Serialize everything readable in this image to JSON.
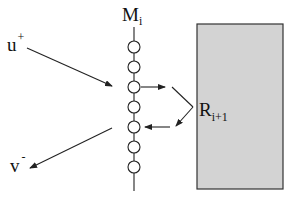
{
  "diagram": {
    "chain_label": {
      "main": "M",
      "sub": "i"
    },
    "incoming_label": {
      "main": "u",
      "sup": "+"
    },
    "outgoing_label": {
      "main": "v",
      "sup": "-"
    },
    "region_label": {
      "main": "R",
      "sub": "i+1"
    },
    "chain_node_count": 7,
    "colors": {
      "stroke": "#222222",
      "region_fill": "#d3d3d3",
      "region_stroke": "#333333",
      "background": "#ffffff"
    }
  }
}
